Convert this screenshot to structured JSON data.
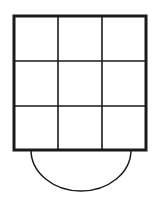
{
  "diagram": {
    "colors": {
      "background": "#ffffff",
      "stroke": "#1a1a1a"
    },
    "grid": {
      "rows": 3,
      "cols": 3,
      "x": 14,
      "y": 16,
      "width": 132,
      "height": 134,
      "outer_stroke_width": 3,
      "inner_stroke_width": 1.6,
      "vertical_lines_x": [
        58,
        102
      ],
      "horizontal_lines_y": [
        61,
        106
      ]
    },
    "arc": {
      "cx": 81,
      "cy": 150,
      "rx": 50,
      "ry": 41,
      "stroke_width": 1.5
    }
  }
}
